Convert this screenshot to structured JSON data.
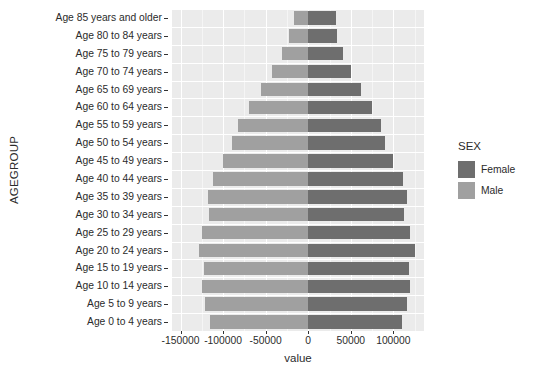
{
  "chart_data": {
    "type": "bar",
    "chart_style": "population-pyramid",
    "title": "",
    "xlabel": "value",
    "ylabel": "AGEGROUP",
    "xlim": [
      -160000,
      136000
    ],
    "xticks": [
      -150000,
      -100000,
      -50000,
      0,
      50000,
      100000
    ],
    "xticklabels": [
      "-150000",
      "-100000",
      "-50000",
      "0",
      "50000",
      "100000"
    ],
    "grid": true,
    "legend": {
      "title": "SEX",
      "position": "right",
      "entries": [
        {
          "label": "Female",
          "color": "#6e6e6e"
        },
        {
          "label": "Male",
          "color": "#a0a0a0"
        }
      ]
    },
    "categories": [
      "Age 85 years and older",
      "Age 80 to 84 years",
      "Age 75 to 79 years",
      "Age 70 to 74 years",
      "Age 65 to 69 years",
      "Age 60 to 64 years",
      "Age 55 to 59 years",
      "Age 50 to 54 years",
      "Age 45 to 49 years",
      "Age 40 to 44 years",
      "Age 35 to 39 years",
      "Age 30 to 34 years",
      "Age 25 to 29 years",
      "Age 20 to 24 years",
      "Age 15 to 19 years",
      "Age 10 to 14 years",
      "Age 5 to 9 years",
      "Age 0 to 4 years"
    ],
    "series": [
      {
        "name": "Male",
        "color": "#a0a0a0",
        "values": [
          -17000,
          -22000,
          -31000,
          -42000,
          -56000,
          -70000,
          -82000,
          -89000,
          -100000,
          -112000,
          -118000,
          -117000,
          -125000,
          -128000,
          -122000,
          -125000,
          -121000,
          -115000
        ]
      },
      {
        "name": "Female",
        "color": "#6e6e6e",
        "values": [
          33000,
          34000,
          41000,
          50000,
          62000,
          75000,
          85000,
          90000,
          100000,
          111000,
          116000,
          113000,
          120000,
          125000,
          118000,
          120000,
          116000,
          110000
        ]
      }
    ]
  },
  "theme": {
    "panel_background": "#ebebeb",
    "gridline_major": "#ffffff",
    "gridline_minor": "#f5f5f5",
    "text_color": "#2b2b2b",
    "figure_background": "#ffffff"
  }
}
